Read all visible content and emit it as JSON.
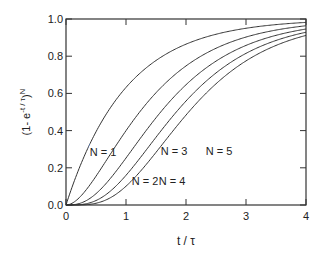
{
  "chart_data": {
    "type": "line",
    "title": "",
    "xlabel": "t / τ",
    "ylabel": "(1- e^-t/τ)^N",
    "xlim": [
      0,
      4
    ],
    "ylim": [
      0,
      1.0
    ],
    "x_ticks": [
      "0",
      "1",
      "2",
      "3",
      "4"
    ],
    "y_ticks": [
      "0.0",
      "0.2",
      "0.4",
      "0.6",
      "0.8",
      "1.0"
    ],
    "grid": false,
    "legend": "inline labels",
    "formula": "y = (1 - exp(-x))^N",
    "series": [
      {
        "name": "N = 1",
        "N": 1,
        "label_pos": [
          103,
          156
        ]
      },
      {
        "name": "N = 2",
        "N": 2,
        "label_pos": [
          145,
          185
        ]
      },
      {
        "name": "N = 3",
        "N": 3,
        "label_pos": [
          174,
          155
        ]
      },
      {
        "name": "N = 4",
        "N": 4,
        "label_pos": [
          172,
          185
        ]
      },
      {
        "name": "N = 5",
        "N": 5,
        "label_pos": [
          219,
          155
        ]
      }
    ],
    "sample_values": {
      "x": [
        0,
        0.5,
        1,
        1.5,
        2,
        2.5,
        3,
        3.5,
        4
      ],
      "N1": [
        0,
        0.39,
        0.63,
        0.78,
        0.86,
        0.92,
        0.95,
        0.97,
        0.98
      ],
      "N2": [
        0,
        0.15,
        0.4,
        0.6,
        0.75,
        0.84,
        0.9,
        0.94,
        0.96
      ],
      "N3": [
        0,
        0.06,
        0.25,
        0.47,
        0.65,
        0.77,
        0.86,
        0.91,
        0.95
      ],
      "N4": [
        0,
        0.02,
        0.16,
        0.37,
        0.56,
        0.71,
        0.82,
        0.88,
        0.93
      ],
      "N5": [
        0,
        0.01,
        0.1,
        0.29,
        0.48,
        0.65,
        0.78,
        0.86,
        0.91
      ]
    }
  }
}
